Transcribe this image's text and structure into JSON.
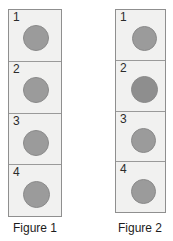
{
  "canvas": {
    "width": 173,
    "height": 241,
    "background": "#ffffff"
  },
  "style": {
    "cell_background": "#f1f1f0",
    "cell_border": "#9a9a9a",
    "column_border": "#8f8f8f",
    "ball_fill": "#9b9b9b",
    "ball_fill_dark": "#8e8e8e",
    "ball_stroke": "#8a8a8a",
    "number_color": "#2b2b2b",
    "caption_color": "#1c1c1c"
  },
  "figures": [
    {
      "id": "figure-1",
      "caption": "Figure 1",
      "column": {
        "left": 8,
        "top": 9,
        "width": 54,
        "height": 208
      },
      "caption_box": {
        "left": 8,
        "top": 221,
        "width": 54
      },
      "cells": [
        {
          "number": "1",
          "ball": {
            "cx": 27,
            "cy": 28,
            "d": 26
          }
        },
        {
          "number": "2",
          "ball": {
            "cx": 27,
            "cy": 28,
            "d": 26
          }
        },
        {
          "number": "3",
          "ball": {
            "cx": 27,
            "cy": 29,
            "d": 26
          }
        },
        {
          "number": "4",
          "ball": {
            "cx": 27,
            "cy": 29,
            "d": 27
          }
        }
      ]
    },
    {
      "id": "figure-2",
      "caption": "Figure 2",
      "column": {
        "left": 115,
        "top": 9,
        "width": 51,
        "height": 204
      },
      "caption_box": {
        "left": 113,
        "top": 221,
        "width": 54
      },
      "cells": [
        {
          "number": "1",
          "ball": {
            "cx": 28,
            "cy": 28,
            "d": 25
          }
        },
        {
          "number": "2",
          "ball": {
            "cx": 28,
            "cy": 29,
            "d": 27
          }
        },
        {
          "number": "3",
          "ball": {
            "cx": 27,
            "cy": 29,
            "d": 25
          }
        },
        {
          "number": "4",
          "ball": {
            "cx": 27,
            "cy": 29,
            "d": 25
          }
        }
      ]
    }
  ]
}
